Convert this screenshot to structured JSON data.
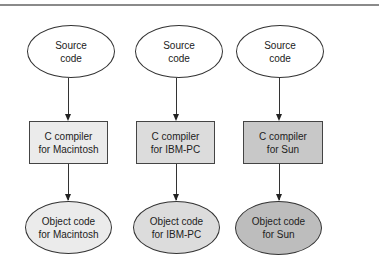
{
  "diagram": {
    "type": "flowchart",
    "columns": [
      {
        "source": {
          "label": "Source\ncode",
          "fill": "#ffffff"
        },
        "compiler": {
          "label": "C compiler\nfor Macintosh",
          "fill": "#ebebeb"
        },
        "object": {
          "label": "Object code\nfor Macintosh",
          "fill": "#ebebeb"
        }
      },
      {
        "source": {
          "label": "Source\ncode",
          "fill": "#ffffff"
        },
        "compiler": {
          "label": "C compiler\nfor IBM-PC",
          "fill": "#dcdcdc"
        },
        "object": {
          "label": "Object code\nfor IBM-PC",
          "fill": "#dcdcdc"
        }
      },
      {
        "source": {
          "label": "Source\ncode",
          "fill": "#ffffff"
        },
        "compiler": {
          "label": "C compiler\nfor Sun",
          "fill": "#c8c8c8"
        },
        "object": {
          "label": "Object code\nfor Sun",
          "fill": "#bdbdbd"
        }
      }
    ]
  }
}
